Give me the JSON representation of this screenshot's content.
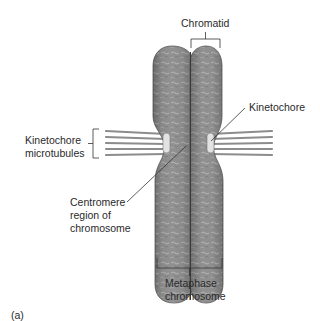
{
  "figure": {
    "panel_label": "(a)",
    "labels": {
      "chromatid": "Chromatid",
      "kinetochore": "Kinetochore",
      "kinetochore_microtubules": [
        "Kinetochore",
        "microtubules"
      ],
      "centromere": [
        "Centromere",
        "region of",
        "chromosome"
      ],
      "metaphase": [
        "Metaphase",
        "chromosome"
      ]
    },
    "colors": {
      "chromatid_fill": "#8a8a8a",
      "chromatid_texture": "#b9b9b9",
      "microtubule": "#8c8c8c",
      "kinetochore": "#e2e2e2",
      "line": "#333333"
    }
  }
}
